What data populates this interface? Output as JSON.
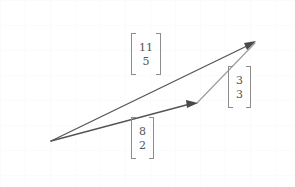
{
  "figure": {
    "type": "vector-addition-diagram",
    "width": 295,
    "height": 187,
    "background_color": "#ffffff",
    "grid": {
      "visible": true,
      "spacing_px": 25,
      "color": "#fbfbfc"
    },
    "stroke_color": "#555555",
    "light_stroke_color": "#9a9a9a",
    "label_color": "#555555",
    "bracket_color": "#8c8c8c"
  },
  "points": {
    "origin": {
      "x": 51,
      "y": 141
    },
    "midpoint": {
      "x": 197,
      "y": 103
    },
    "tip": {
      "x": 255,
      "y": 42
    }
  },
  "vectors": [
    {
      "name": "base-vector",
      "label_id": "label-base",
      "components": [
        "8",
        "2"
      ],
      "from": "origin",
      "to": "midpoint",
      "arrowhead": true,
      "emphasis": "strong"
    },
    {
      "name": "sum-vector",
      "label_id": "label-sum",
      "components": [
        "11",
        "5"
      ],
      "from": "origin",
      "to": "tip",
      "arrowhead": true,
      "emphasis": "strong"
    },
    {
      "name": "delta-vector",
      "label_id": "label-delta",
      "components": [
        "3",
        "3"
      ],
      "from": "midpoint",
      "to": "tip",
      "arrowhead": false,
      "emphasis": "light"
    }
  ],
  "labels": {
    "sum": {
      "top": "11",
      "bottom": "5"
    },
    "base": {
      "top": "8",
      "bottom": "2"
    },
    "delta": {
      "top": "3",
      "bottom": "3"
    }
  }
}
